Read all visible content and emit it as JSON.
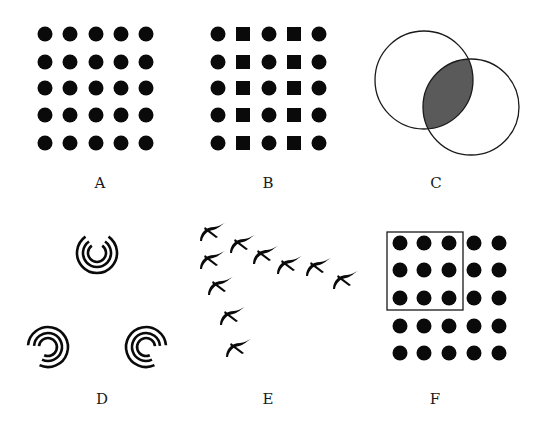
{
  "figure": {
    "colors": {
      "ink": "#0a0a0a",
      "shade": "#5a5a5a",
      "background": "#ffffff"
    },
    "panels": [
      {
        "id": "A",
        "label": "A",
        "description": "5x5 grid of uniform black dots"
      },
      {
        "id": "B",
        "label": "B",
        "description": "5x5 grid alternating columns of circles and squares"
      },
      {
        "id": "C",
        "label": "C",
        "description": "Two overlapping circles with shaded intersection"
      },
      {
        "id": "D",
        "label": "D",
        "description": "Three sets of concentric broken arcs forming an implied triangle"
      },
      {
        "id": "E",
        "label": "E",
        "description": "Ten birds flying in a V formation"
      },
      {
        "id": "F",
        "label": "F",
        "description": "5x5 grid of dots with a rectangle enclosing the top-left 3x3"
      }
    ],
    "panel_A": {
      "rows": 5,
      "cols": 5,
      "shape": "circle"
    },
    "panel_B": {
      "rows": 5,
      "cols": 5,
      "column_shapes": [
        "circle",
        "square",
        "circle",
        "square",
        "circle"
      ]
    },
    "panel_C": {
      "circles": 2,
      "shaded_region": "intersection"
    },
    "panel_D": {
      "groups": 3,
      "arcs_per_group": 3
    },
    "panel_E": {
      "bird_count": 10
    },
    "panel_F": {
      "rows": 5,
      "cols": 5,
      "enclosed_rows": 3,
      "enclosed_cols": 3
    }
  }
}
